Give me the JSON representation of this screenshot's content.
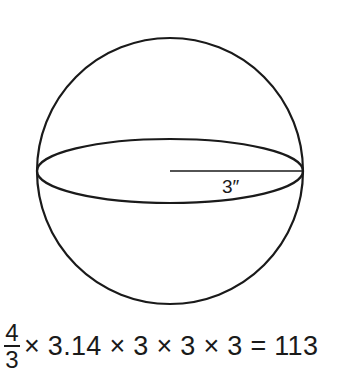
{
  "diagram": {
    "shape": "sphere",
    "radius_label": "3″",
    "stroke_color": "#1a1a1a",
    "background": "#ffffff"
  },
  "formula": {
    "fraction_numerator": "4",
    "fraction_denominator": "3",
    "expression": "× 3.14 × 3 × 3 × 3 = 113"
  }
}
